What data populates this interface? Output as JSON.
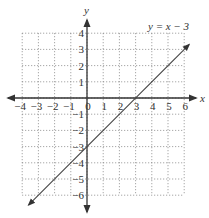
{
  "chart_data": {
    "type": "line",
    "title": "y = x − 3",
    "xlabel": "x",
    "ylabel": "y",
    "xlim": [
      -4,
      6
    ],
    "ylim": [
      -6,
      4
    ],
    "grid": true,
    "grid_style": "dotted",
    "x_ticks": [
      "−4",
      "−3",
      "−2",
      "−1",
      "0",
      "1",
      "2",
      "3",
      "4",
      "5",
      "6"
    ],
    "y_ticks": [
      "4",
      "3",
      "2",
      "1",
      "−1",
      "−2",
      "−3",
      "−4",
      "−5",
      "−6"
    ],
    "series": [
      {
        "name": "y = x − 3",
        "x": [
          -3.6,
          6.3
        ],
        "y": [
          -6.6,
          3.3
        ],
        "arrows": "both"
      }
    ],
    "annotations": [
      {
        "text": "y = x − 3",
        "position": "top-right"
      }
    ],
    "colors": {
      "axis": "#333333",
      "line": "#444444",
      "grid": "#777777"
    }
  },
  "labels": {
    "equation": "y = x − 3",
    "x_axis": "x",
    "y_axis": "y"
  }
}
